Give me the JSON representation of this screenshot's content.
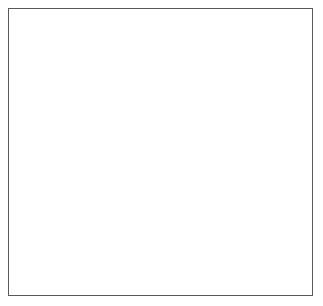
{
  "figure": {
    "background_color": "#ffffff",
    "frame_color": "#5a5a5a",
    "ink_color": "#1b1b1b",
    "view": "posterior",
    "side": "right"
  },
  "annotations": [
    {
      "id": "rhomboid",
      "label": "Rhomboid",
      "text_x": 240,
      "text_y": 58,
      "leader": {
        "x1": 237,
        "y1": 55,
        "x2": 221,
        "y2": 68
      },
      "anchor": "start"
    },
    {
      "id": "latissimus-dorsi",
      "label": "Latissimus dorsi",
      "text_x": 29,
      "text_y": 197,
      "leader": {
        "x1": 113,
        "y1": 194,
        "x2": 163,
        "y2": 180
      },
      "anchor": "start"
    }
  ],
  "structures": {
    "skin_contour": "neck and arm outline",
    "scapula": "scapula body, spine and acromion",
    "humerus": "humeral head and proximal shaft",
    "rhomboid": "rhomboid major and minor",
    "latissimus_dorsi": "latissimus dorsi fan",
    "infraspinatus": "infraspinatus and teres group",
    "spinous_processes": "thoracic spinous processes",
    "ribs": "posterior rib shading"
  },
  "palette": {
    "bone_light": "#f2efe9",
    "bone_mid": "#b9b3a8",
    "bone_dark": "#6d675d",
    "muscle_light": "#cfcac2",
    "muscle_mid": "#8a8379",
    "muscle_dark": "#3f3b36",
    "fiber": "#2e2b28",
    "outline": "#1b1b1b"
  }
}
